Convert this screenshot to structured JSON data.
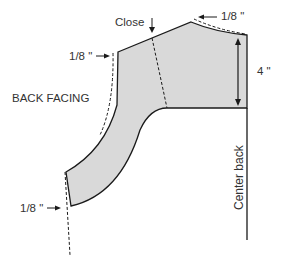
{
  "diagram": {
    "title": "BACK FACING",
    "labels": {
      "close": "Close",
      "shoulder_allowance": "1/8 \"",
      "armhole_allowance": "1/8 \"",
      "hem_allowance": "1/8 \"",
      "depth": "4 \"",
      "center_back": "Center back"
    },
    "colors": {
      "fill": "#d9d9d9",
      "outline": "#1a1a1a",
      "text": "#333333"
    }
  }
}
